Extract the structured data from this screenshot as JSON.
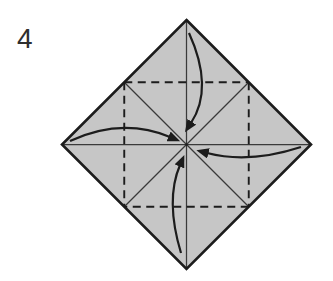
{
  "step_label": "4",
  "colors": {
    "background": "#ffffff",
    "paper_fill": "#c6c6c6",
    "line_ink": "#1c1c1c",
    "step_number": "#2e2e2e"
  },
  "diagram": {
    "icon_names": [
      "paper-square-diamond",
      "valley-fold-dashed-square",
      "crease-diagonal-lines",
      "fold-arrow-top",
      "fold-arrow-right",
      "fold-arrow-bottom",
      "fold-arrow-left"
    ]
  }
}
